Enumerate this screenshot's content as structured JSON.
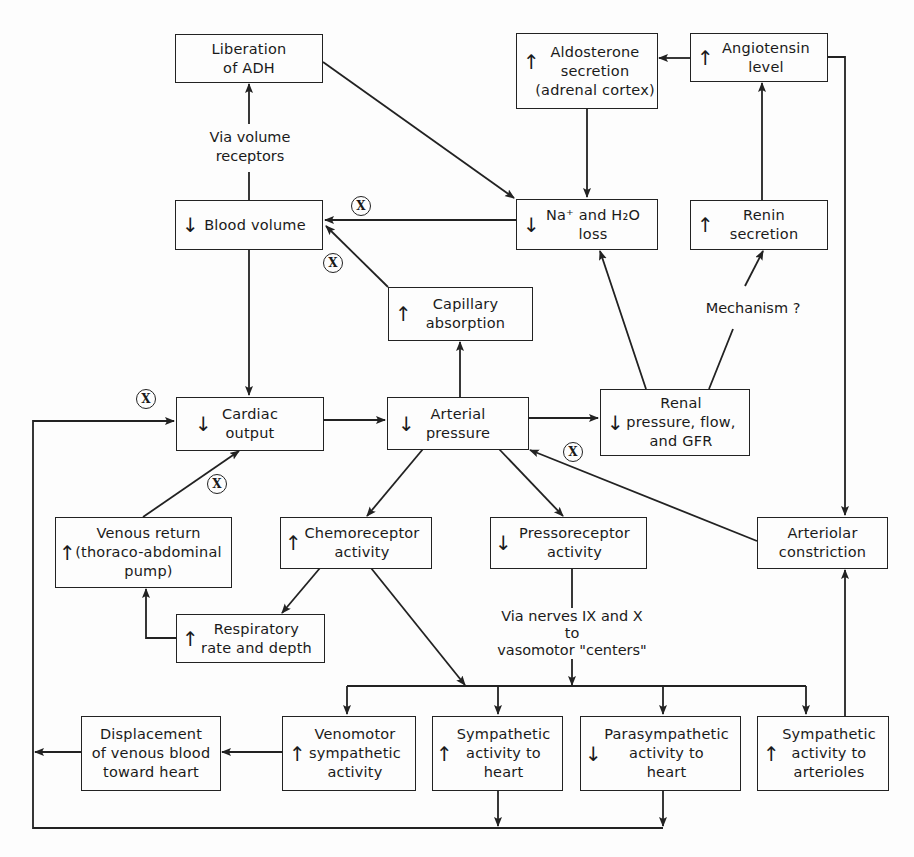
{
  "diagram": {
    "nodes": {
      "adh": {
        "arrow": "",
        "text": "Liberation\nof ADH"
      },
      "aldosterone": {
        "arrow": "↑",
        "text": "Aldosterone\nsecretion\n(adrenal cortex)"
      },
      "angiotensin": {
        "arrow": "↑",
        "text": "Angiotensin\nlevel"
      },
      "blood_volume": {
        "arrow": "↓",
        "text": "Blood volume"
      },
      "na_h2o": {
        "arrow": "↓",
        "text": "Na⁺ and H₂O\nloss"
      },
      "renin": {
        "arrow": "↑",
        "text": "Renin\nsecretion"
      },
      "capillary": {
        "arrow": "↑",
        "text": "Capillary\nabsorption"
      },
      "cardiac_output": {
        "arrow": "↓",
        "text": "Cardiac\noutput"
      },
      "arterial_pressure": {
        "arrow": "↓",
        "text": "Arterial\npressure"
      },
      "renal": {
        "arrow": "↓",
        "text": "Renal\npressure, flow,\nand GFR"
      },
      "venous_return": {
        "arrow": "↑",
        "text": "Venous return\n(thoraco-abdominal\npump)"
      },
      "chemoreceptor": {
        "arrow": "↑",
        "text": "Chemoreceptor\nactivity"
      },
      "pressoreceptor": {
        "arrow": "↓",
        "text": "Pressoreceptor\nactivity"
      },
      "arteriolar": {
        "arrow": "",
        "text": "Arteriolar\nconstriction"
      },
      "respiratory": {
        "arrow": "↑",
        "text": "Respiratory\nrate and depth"
      },
      "displacement": {
        "arrow": "",
        "text": "Displacement\nof venous blood\ntoward heart"
      },
      "venomotor": {
        "arrow": "↑",
        "text": "Venomotor\nsympathetic\nactivity"
      },
      "symp_heart": {
        "arrow": "↑",
        "text": "Sympathetic\nactivity to\nheart"
      },
      "parasymp_heart": {
        "arrow": "↓",
        "text": "Parasympathetic\nactivity to\nheart"
      },
      "symp_arterioles": {
        "arrow": "↑",
        "text": "Sympathetic\nactivity to\narterioles"
      }
    },
    "labels": {
      "volume_receptors": "Via volume\nreceptors",
      "mechanism": "Mechanism ?",
      "nerves": "Via nerves IX and X\nto\nvasomotor \"centers\""
    },
    "x_marker": "X"
  }
}
